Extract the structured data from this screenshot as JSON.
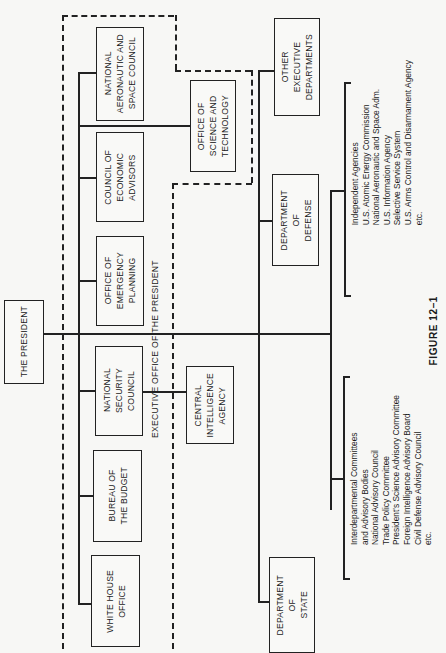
{
  "chart": {
    "president": "THE PRESIDENT",
    "executive_office": {
      "label": "EXECUTIVE OFFICE OF THE PRESIDENT",
      "units": [
        {
          "name": "NATIONAL\nAERONAUTIC AND\nSPACE COUNCIL"
        },
        {
          "name": "COUNCIL OF\nECONOMIC\nADVISORS"
        },
        {
          "name": "OFFICE OF\nEMERGENCY\nPLANNING"
        },
        {
          "name": "NATIONAL\nSECURITY\nCOUNCIL"
        },
        {
          "name": "BUREAU OF\nTHE BUDGET"
        },
        {
          "name": "WHITE HOUSE\nOFFICE"
        }
      ],
      "science_office": "OFFICE OF\nSCIENCE AND\nTECHNOLOGY"
    },
    "cia": "CENTRAL\nINTELLIGENCE\nAGENCY",
    "departments": [
      {
        "name": "OTHER\nEXECUTIVE\nDEPARTMENTS"
      },
      {
        "name": "DEPARTMENT\nOF\nDEFENSE"
      },
      {
        "name": "DEPARTMENT\nOF\nSTATE"
      }
    ],
    "independent_agencies": {
      "items": [
        "Independent Agencies",
        "U.S. Atomic Energy Commission",
        "National Aeronautic and Space Adm.",
        "U.S. Information Agency",
        "Selective Service System",
        "U.S. Arms Control and Disarmament Agency",
        "etc."
      ]
    },
    "interdepartmental": {
      "items": [
        "Interdepartmental Committees",
        "and Advisory Bodies",
        "National Advisory Council",
        "Trade Policy Committee",
        "President's Science Advisory Committee",
        "Foreign Intelligence Advisory Board",
        "Civil Defense Advisory Council",
        "etc."
      ]
    },
    "caption": "FIGURE 12–1"
  }
}
